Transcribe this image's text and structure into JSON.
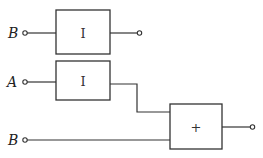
{
  "diagram": {
    "type": "block-diagram",
    "inputs": [
      {
        "id": "in-b-top",
        "label": "B"
      },
      {
        "id": "in-a",
        "label": "A"
      },
      {
        "id": "in-b-bottom",
        "label": "B"
      }
    ],
    "blocks": [
      {
        "id": "block-top",
        "symbol": "I",
        "inputs": [
          "in-b-top"
        ]
      },
      {
        "id": "block-middle",
        "symbol": "I",
        "inputs": [
          "in-a"
        ]
      },
      {
        "id": "block-sum",
        "symbol": "+",
        "inputs": [
          "block-middle",
          "in-b-bottom"
        ]
      }
    ],
    "outputs": [
      "block-top",
      "block-sum"
    ],
    "colors": {
      "stroke": "#333333",
      "background": "#ffffff"
    }
  }
}
